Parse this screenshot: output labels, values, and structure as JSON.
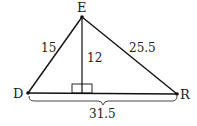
{
  "diagram": {
    "type": "triangle-with-altitude",
    "vertices": {
      "E": {
        "label": "E",
        "x": 82,
        "y": 17
      },
      "D": {
        "label": "D",
        "x": 28,
        "y": 93
      },
      "R": {
        "label": "R",
        "x": 177,
        "y": 94
      }
    },
    "foot": {
      "x": 82,
      "y": 93
    },
    "measurements": {
      "DE": "15",
      "ER": "25.5",
      "altitude": "12",
      "DR": "31.5"
    },
    "right_angle_marker": true,
    "colors": {
      "stroke": "#111111",
      "text": "#222222",
      "background": "#ffffff"
    }
  }
}
